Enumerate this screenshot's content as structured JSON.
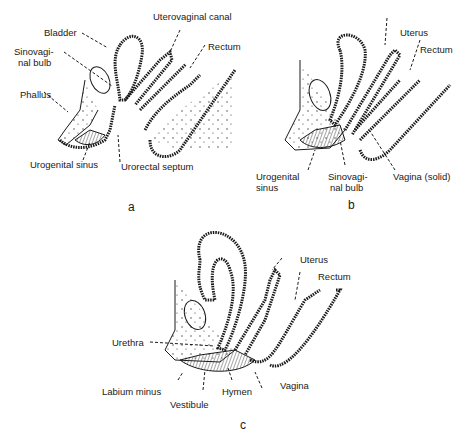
{
  "panels": [
    {
      "id": "a",
      "letter": "a",
      "labels": [
        "Bladder",
        "Uterovaginal canal",
        "Sinovagi-",
        "nal bulb",
        "Rectum",
        "Phallus",
        "Urogenital sinus",
        "Urorectal septum"
      ]
    },
    {
      "id": "b",
      "letter": "b",
      "labels": [
        "Uterus",
        "Rectum",
        "Urogenital",
        "sinus",
        "Sinovagi-",
        "nal bulb",
        "Vagina (solid)"
      ]
    },
    {
      "id": "c",
      "letter": "c",
      "labels": [
        "Uterus",
        "Rectum",
        "Urethra",
        "Labium minus",
        "Vestibule",
        "Hymen",
        "Vagina"
      ]
    }
  ],
  "colors": {
    "ink": "#1a1a1a",
    "background": "#ffffff"
  }
}
